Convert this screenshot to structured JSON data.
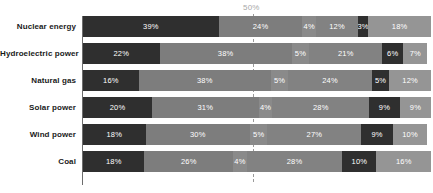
{
  "chart_data": {
    "type": "bar",
    "orientation": "horizontal",
    "stacked": true,
    "normalized": true,
    "title": "",
    "xlabel": "",
    "ylabel": "",
    "xlim": [
      0,
      100
    ],
    "grid": false,
    "legend": "none",
    "data_labels": true,
    "data_label_format": "percent",
    "annotations": [
      {
        "name": "reference-line",
        "label": "50%",
        "value": 50,
        "style": "dashed vertical"
      }
    ],
    "categories": [
      "Nuclear energy",
      "Hydroelectric power",
      "Natural gas",
      "Solar power",
      "Wind power",
      "Coal"
    ],
    "series": [
      {
        "name": "Segment 1",
        "color": "#2f2f2f",
        "values": [
          39,
          22,
          16,
          20,
          18,
          18
        ]
      },
      {
        "name": "Segment 2",
        "color": "#7d7d7d",
        "values": [
          24,
          38,
          38,
          31,
          30,
          26
        ]
      },
      {
        "name": "Segment 3",
        "color": "#8a8a8a",
        "values": [
          4,
          5,
          5,
          4,
          5,
          4
        ]
      },
      {
        "name": "Segment 4",
        "color": "#828282",
        "values": [
          12,
          21,
          24,
          28,
          27,
          28
        ]
      },
      {
        "name": "Segment 5",
        "color": "#2f2f2f",
        "values": [
          3,
          6,
          5,
          9,
          9,
          10
        ]
      },
      {
        "name": "Segment 6",
        "color": "#959595",
        "values": [
          18,
          7,
          12,
          9,
          10,
          16
        ]
      }
    ],
    "rows": [
      {
        "label": "Nuclear energy",
        "segments": [
          {
            "value": 39,
            "text": "39%",
            "color": "#2f2f2f"
          },
          {
            "value": 24,
            "text": "24%",
            "color": "#7d7d7d"
          },
          {
            "value": 4,
            "text": "4%",
            "color": "#8a8a8a"
          },
          {
            "value": 12,
            "text": "12%",
            "color": "#828282"
          },
          {
            "value": 3,
            "text": "3%",
            "color": "#2f2f2f"
          },
          {
            "value": 18,
            "text": "18%",
            "color": "#959595"
          }
        ]
      },
      {
        "label": "Hydroelectric power",
        "segments": [
          {
            "value": 22,
            "text": "22%",
            "color": "#2f2f2f"
          },
          {
            "value": 38,
            "text": "38%",
            "color": "#7d7d7d"
          },
          {
            "value": 5,
            "text": "5%",
            "color": "#8a8a8a"
          },
          {
            "value": 21,
            "text": "21%",
            "color": "#828282"
          },
          {
            "value": 6,
            "text": "6%",
            "color": "#2f2f2f"
          },
          {
            "value": 7,
            "text": "7%",
            "color": "#959595"
          }
        ]
      },
      {
        "label": "Natural gas",
        "segments": [
          {
            "value": 16,
            "text": "16%",
            "color": "#2f2f2f"
          },
          {
            "value": 38,
            "text": "38%",
            "color": "#7d7d7d"
          },
          {
            "value": 5,
            "text": "5%",
            "color": "#8a8a8a"
          },
          {
            "value": 24,
            "text": "24%",
            "color": "#828282"
          },
          {
            "value": 5,
            "text": "5%",
            "color": "#2f2f2f"
          },
          {
            "value": 12,
            "text": "12%",
            "color": "#959595"
          }
        ]
      },
      {
        "label": "Solar power",
        "segments": [
          {
            "value": 20,
            "text": "20%",
            "color": "#2f2f2f"
          },
          {
            "value": 31,
            "text": "31%",
            "color": "#7d7d7d"
          },
          {
            "value": 4,
            "text": "4%",
            "color": "#8a8a8a"
          },
          {
            "value": 28,
            "text": "28%",
            "color": "#828282"
          },
          {
            "value": 9,
            "text": "9%",
            "color": "#2f2f2f"
          },
          {
            "value": 9,
            "text": "9%",
            "color": "#959595"
          }
        ]
      },
      {
        "label": "Wind power",
        "segments": [
          {
            "value": 18,
            "text": "18%",
            "color": "#2f2f2f"
          },
          {
            "value": 30,
            "text": "30%",
            "color": "#7d7d7d"
          },
          {
            "value": 5,
            "text": "5%",
            "color": "#8a8a8a"
          },
          {
            "value": 27,
            "text": "27%",
            "color": "#828282"
          },
          {
            "value": 9,
            "text": "9%",
            "color": "#2f2f2f"
          },
          {
            "value": 10,
            "text": "10%",
            "color": "#959595"
          }
        ]
      },
      {
        "label": "Coal",
        "segments": [
          {
            "value": 18,
            "text": "18%",
            "color": "#2f2f2f"
          },
          {
            "value": 26,
            "text": "26%",
            "color": "#7d7d7d"
          },
          {
            "value": 4,
            "text": "4%",
            "color": "#8a8a8a"
          },
          {
            "value": 28,
            "text": "28%",
            "color": "#828282"
          },
          {
            "value": 10,
            "text": "10%",
            "color": "#2f2f2f"
          },
          {
            "value": 16,
            "text": "16%",
            "color": "#959595"
          }
        ]
      }
    ],
    "colors": {
      "dark": "#2f2f2f",
      "mid": "#7d7d7d",
      "mid_light": "#8a8a8a",
      "mid_alt": "#828282",
      "light": "#959595",
      "axis": "#6d6d6d",
      "reference": "#9a9a9a",
      "label_text": "#1a1a1a",
      "value_text": "#ffffff",
      "background": "#ffffff"
    }
  }
}
